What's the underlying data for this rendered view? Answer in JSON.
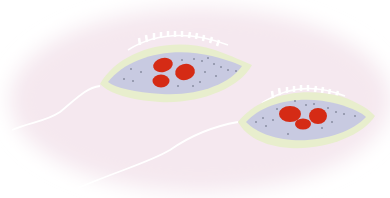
{
  "illustration": {
    "subject": "Two flagellated protozoa (trypanosome-like cells)",
    "background_color": "#f7ebf2",
    "colors": {
      "cytoplasm": "#c9cbe2",
      "membrane": "#e9efcf",
      "nucleus": "#d62a14",
      "granules": "#8a8ea0",
      "flagellum": "#ffffff"
    },
    "organisms": [
      {
        "id": "organism-1",
        "nuclei_count": 3
      },
      {
        "id": "organism-2",
        "nuclei_count": 3
      }
    ]
  }
}
